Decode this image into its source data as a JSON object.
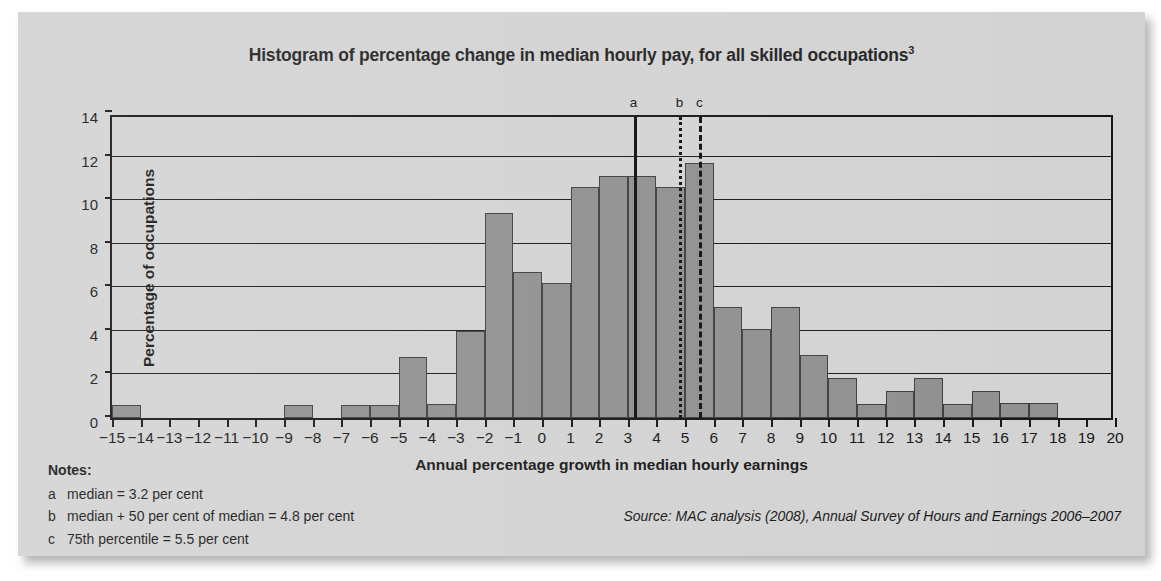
{
  "chart_data": {
    "type": "bar",
    "title": "Histogram of percentage change in median hourly pay, for all skilled occupations",
    "title_superscript": "3",
    "xlabel": "Annual percentage growth in median hourly earnings",
    "ylabel": "Percentage of occupations",
    "xlim": [
      -15,
      20
    ],
    "ylim": [
      0,
      14
    ],
    "yticks": [
      0,
      2,
      4,
      6,
      8,
      10,
      12,
      14
    ],
    "xticks": [
      -15,
      -14,
      -13,
      -12,
      -11,
      -10,
      -9,
      -8,
      -7,
      -6,
      -5,
      -4,
      -3,
      -2,
      -1,
      0,
      1,
      2,
      3,
      4,
      5,
      6,
      7,
      8,
      9,
      10,
      11,
      12,
      13,
      14,
      15,
      16,
      17,
      18,
      19,
      20
    ],
    "xtick_labels": [
      "−15",
      "−14",
      "−13",
      "−12",
      "−11",
      "−10",
      "−9",
      "−8",
      "−7",
      "−6",
      "−5",
      "−4",
      "−3",
      "−2",
      "−1",
      "0",
      "1",
      "2",
      "3",
      "4",
      "5",
      "6",
      "7",
      "8",
      "9",
      "10",
      "11",
      "12",
      "13",
      "14",
      "15",
      "16",
      "17",
      "18",
      "19",
      "20"
    ],
    "grid": "horizontal",
    "bin_width": 1,
    "bar_color": "#8d8d8d",
    "bars": [
      {
        "bin_start": -15,
        "value": 0.6
      },
      {
        "bin_start": -14,
        "value": 0
      },
      {
        "bin_start": -13,
        "value": 0
      },
      {
        "bin_start": -12,
        "value": 0
      },
      {
        "bin_start": -11,
        "value": 0
      },
      {
        "bin_start": -10,
        "value": 0
      },
      {
        "bin_start": -9,
        "value": 0.6
      },
      {
        "bin_start": -8,
        "value": 0
      },
      {
        "bin_start": -7,
        "value": 0.6
      },
      {
        "bin_start": -6,
        "value": 0.6
      },
      {
        "bin_start": -5,
        "value": 2.8
      },
      {
        "bin_start": -4,
        "value": 0.65
      },
      {
        "bin_start": -3,
        "value": 4.0
      },
      {
        "bin_start": -2,
        "value": 9.4
      },
      {
        "bin_start": -1,
        "value": 6.7
      },
      {
        "bin_start": 0,
        "value": 6.2
      },
      {
        "bin_start": 1,
        "value": 10.6
      },
      {
        "bin_start": 2,
        "value": 11.1
      },
      {
        "bin_start": 3,
        "value": 11.1
      },
      {
        "bin_start": 4,
        "value": 10.6
      },
      {
        "bin_start": 5,
        "value": 11.7
      },
      {
        "bin_start": 6,
        "value": 5.1
      },
      {
        "bin_start": 7,
        "value": 4.1
      },
      {
        "bin_start": 8,
        "value": 5.1
      },
      {
        "bin_start": 9,
        "value": 2.9
      },
      {
        "bin_start": 10,
        "value": 1.85
      },
      {
        "bin_start": 11,
        "value": 0.65
      },
      {
        "bin_start": 12,
        "value": 1.25
      },
      {
        "bin_start": 13,
        "value": 1.85
      },
      {
        "bin_start": 14,
        "value": 0.65
      },
      {
        "bin_start": 15,
        "value": 1.25
      },
      {
        "bin_start": 16,
        "value": 0.7
      },
      {
        "bin_start": 17,
        "value": 0.7
      },
      {
        "bin_start": 18,
        "value": 0
      },
      {
        "bin_start": 19,
        "value": 0
      }
    ],
    "markers": [
      {
        "id": "a",
        "label": "a",
        "x": 3.2,
        "style": "solid"
      },
      {
        "id": "b",
        "label": "b",
        "x": 4.8,
        "style": "dotted"
      },
      {
        "id": "c",
        "label": "c",
        "x": 5.5,
        "style": "dashed"
      }
    ]
  },
  "notes": {
    "heading": "Notes:",
    "items": [
      {
        "key": "a",
        "text": "median = 3.2 per cent"
      },
      {
        "key": "b",
        "text": "median + 50 per cent of median = 4.8 per cent"
      },
      {
        "key": "c",
        "text": "75th percentile = 5.5 per cent"
      }
    ]
  },
  "source": "Source: MAC analysis (2008), Annual Survey of Hours and Earnings 2006–2007"
}
